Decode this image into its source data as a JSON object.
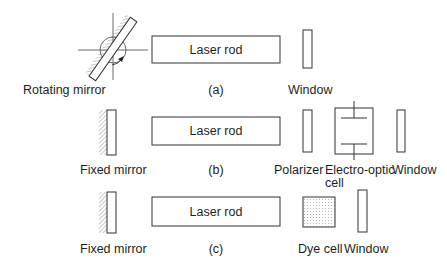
{
  "figure": {
    "panels": [
      {
        "id": "a",
        "caption": "(a)",
        "rod_label": "Laser rod",
        "components": [
          {
            "label": "Rotating mirror"
          },
          {
            "label": "Laser rod"
          },
          {
            "label": "Window"
          }
        ]
      },
      {
        "id": "b",
        "caption": "(b)",
        "rod_label": "Laser rod",
        "components": [
          {
            "label": "Fixed mirror"
          },
          {
            "label": "Laser rod"
          },
          {
            "label": "Polarizer"
          },
          {
            "label_line1": "Electro-optic",
            "label_line2": "cell"
          },
          {
            "label": "Window"
          }
        ]
      },
      {
        "id": "c",
        "caption": "(c)",
        "rod_label": "Laser rod",
        "components": [
          {
            "label": "Fixed mirror"
          },
          {
            "label": "Laser rod"
          },
          {
            "label": "Dye cell"
          },
          {
            "label": "Window"
          }
        ]
      }
    ]
  },
  "colors": {
    "line": "#333333",
    "hatch": "#777777",
    "background": "#ffffff"
  }
}
